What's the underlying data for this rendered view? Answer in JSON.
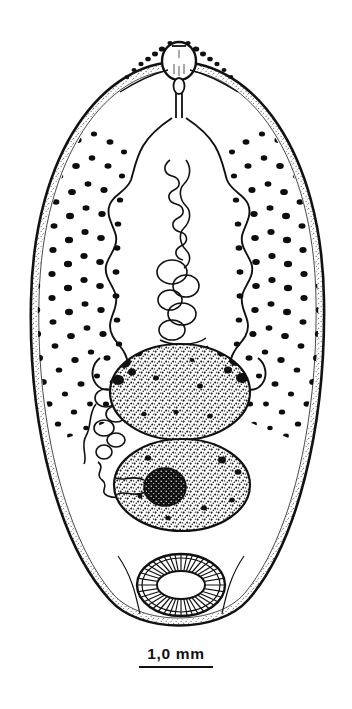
{
  "figure": {
    "organism_type": "digenean-fluke",
    "orientation": "anterior-at-top",
    "ink_color": "#111111",
    "background_color": "#ffffff",
    "body": {
      "name": "body-outline",
      "shape": "elongate-oval",
      "left_px": 30,
      "right_px": 326,
      "top_px": 62,
      "bottom_px": 626,
      "center_x_px": 178,
      "edge_shading": "stippled-margin"
    },
    "structures": [
      {
        "key": "oral-sucker",
        "label": "oral sucker",
        "cx": 179,
        "cy": 61,
        "rx": 17,
        "ry": 19
      },
      {
        "key": "pharynx",
        "label": "pharynx",
        "cx": 179,
        "cy": 88,
        "rx": 5,
        "ry": 8
      },
      {
        "key": "esophagus",
        "label": "esophagus",
        "cx": 179,
        "cy": 110,
        "rx": 3,
        "ry": 14
      },
      {
        "key": "cecum-left",
        "label": "intestinal cecum (left)",
        "cx": 120,
        "cy": 250,
        "rx": 28,
        "ry": 130
      },
      {
        "key": "cecum-right",
        "label": "intestinal cecum (right)",
        "cx": 238,
        "cy": 250,
        "rx": 28,
        "ry": 130
      },
      {
        "key": "uterus",
        "label": "uterus (coiled)",
        "cx": 176,
        "cy": 250,
        "rx": 18,
        "ry": 100
      },
      {
        "key": "vitellaria-left",
        "label": "vitelline follicles (left field)",
        "cx": 85,
        "cy": 265,
        "rx": 55,
        "ry": 140
      },
      {
        "key": "vitellaria-right",
        "label": "vitelline follicles (right field)",
        "cx": 272,
        "cy": 265,
        "rx": 55,
        "ry": 140
      },
      {
        "key": "testis-anterior",
        "label": "anterior testis",
        "cx": 180,
        "cy": 392,
        "rx": 70,
        "ry": 48
      },
      {
        "key": "testis-posterior",
        "label": "posterior testis",
        "cx": 182,
        "cy": 485,
        "rx": 68,
        "ry": 46
      },
      {
        "key": "ovary",
        "label": "ovary",
        "cx": 165,
        "cy": 487,
        "rx": 21,
        "ry": 19
      },
      {
        "key": "ootype-complex",
        "label": "ootype / Mehlis gland complex",
        "cx": 110,
        "cy": 430,
        "rx": 22,
        "ry": 45
      },
      {
        "key": "acetabulum",
        "label": "acetabulum (ventral sucker)",
        "cx": 181,
        "cy": 585,
        "rx": 44,
        "ry": 31
      },
      {
        "key": "acetabulum-aperture",
        "label": "acetabulum aperture",
        "cx": 181,
        "cy": 585,
        "rx": 24,
        "ry": 14
      }
    ]
  },
  "scale_bar": {
    "label": "1,0 mm",
    "value": 1.0,
    "unit": "mm",
    "bar_length_px": 74,
    "position": "below-figure-centered"
  }
}
